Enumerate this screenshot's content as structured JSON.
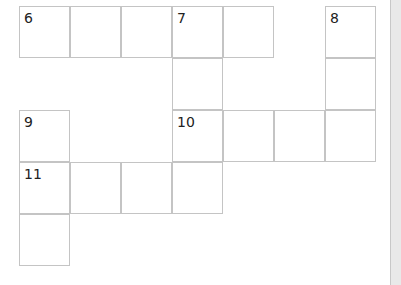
{
  "puzzle": {
    "cells": [
      {
        "row": 0,
        "col": 0,
        "number": "6"
      },
      {
        "row": 0,
        "col": 1,
        "number": ""
      },
      {
        "row": 0,
        "col": 2,
        "number": ""
      },
      {
        "row": 0,
        "col": 3,
        "number": "7"
      },
      {
        "row": 0,
        "col": 4,
        "number": ""
      },
      {
        "row": 0,
        "col": 6,
        "number": "8"
      },
      {
        "row": 1,
        "col": 3,
        "number": ""
      },
      {
        "row": 1,
        "col": 6,
        "number": ""
      },
      {
        "row": 2,
        "col": 0,
        "number": "9"
      },
      {
        "row": 2,
        "col": 3,
        "number": "10"
      },
      {
        "row": 2,
        "col": 4,
        "number": ""
      },
      {
        "row": 2,
        "col": 5,
        "number": ""
      },
      {
        "row": 2,
        "col": 6,
        "number": ""
      },
      {
        "row": 3,
        "col": 0,
        "number": "11"
      },
      {
        "row": 3,
        "col": 1,
        "number": ""
      },
      {
        "row": 3,
        "col": 2,
        "number": ""
      },
      {
        "row": 3,
        "col": 3,
        "number": ""
      },
      {
        "row": 4,
        "col": 0,
        "number": ""
      }
    ]
  }
}
